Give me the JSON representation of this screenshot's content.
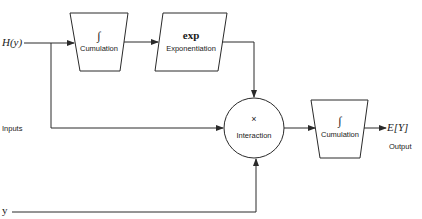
{
  "diagram": {
    "inputs_label": "Inputs",
    "input_h": "H(y)",
    "input_y": "y",
    "blocks": [
      {
        "id": "cumulation-1",
        "symbol": "∫",
        "label": "Cumulation",
        "shape": "trapezoid"
      },
      {
        "id": "exponentiation",
        "symbol": "exp",
        "label": "Exponentiation",
        "shape": "parallelogram"
      },
      {
        "id": "interaction",
        "symbol": "×",
        "label": "Interaction",
        "shape": "circle"
      },
      {
        "id": "cumulation-2",
        "symbol": "∫",
        "label": "Cumulation",
        "shape": "trapezoid"
      }
    ],
    "output_value": "E[Y]",
    "output_label": "Output",
    "colors": {
      "stroke": "#2a2a2a",
      "background": "#ffffff"
    }
  }
}
